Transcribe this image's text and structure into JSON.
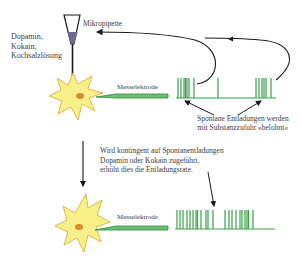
{
  "diagram": {
    "labels": {
      "substances": "Dopamin,\nKokain,\nKochsalzlösung",
      "pipette": "Mikropipette",
      "electrode_top": "Messelektrode",
      "electrode_bottom": "Messelektrode",
      "spontaneous_caption": "Spontane Entladungen werden\nmit Substanzzufuhr »belohnt«",
      "contingent_caption": "Wird kontingent auf Spontanentladungen\nDopamin oder Kokain zugeführt,\nerhöht dies die Entladungsrate."
    },
    "colors": {
      "neuron_fill": "#faf08a",
      "neuron_stroke": "#e0b84a",
      "nucleus": "#d98a2a",
      "electrode": "#3aa04a",
      "spike": "#3aa04a",
      "pipette_fluid": "#6e6a94",
      "arrow": "#1a1a1a",
      "text": "#3d3d3d"
    },
    "nodes": [
      {
        "id": "pipette",
        "label": "Mikropipette",
        "type": "instrument"
      },
      {
        "id": "neuron_before",
        "label": "Neuron (vorher)",
        "type": "cell"
      },
      {
        "id": "electrode_before",
        "label": "Messelektrode",
        "type": "instrument"
      },
      {
        "id": "spike_train_before",
        "label": "Spontane Entladungen",
        "type": "signal"
      },
      {
        "id": "neuron_after",
        "label": "Neuron (nachher)",
        "type": "cell"
      },
      {
        "id": "electrode_after",
        "label": "Messelektrode",
        "type": "instrument"
      },
      {
        "id": "spike_train_after",
        "label": "Erhöhte Entladungsrate",
        "type": "signal"
      }
    ],
    "edges": [
      {
        "from": "spike_train_before",
        "to": "pipette",
        "label": "Substanzzufuhr bei Burst 1"
      },
      {
        "from": "spike_train_before",
        "to": "pipette",
        "label": "Substanzzufuhr bei Burst 2"
      },
      {
        "from": "neuron_before",
        "to": "neuron_after",
        "label": "Konditionierung"
      }
    ],
    "spike_trains": {
      "top": {
        "baseline_y": 98,
        "x_start": 176,
        "x_end": 276,
        "spike_height": 19,
        "spikes_x": [
          178,
          181,
          184,
          185,
          187,
          189,
          194,
          218,
          256,
          259,
          262,
          264,
          266,
          271
        ]
      },
      "bottom": {
        "baseline_y": 229,
        "x_start": 175,
        "x_end": 275,
        "spike_height": 19,
        "spikes_x": [
          177,
          180,
          183,
          187,
          190,
          193,
          196,
          197,
          201,
          206,
          208,
          213,
          225,
          229,
          232,
          236,
          240,
          242,
          245,
          247,
          248,
          253
        ]
      }
    }
  }
}
